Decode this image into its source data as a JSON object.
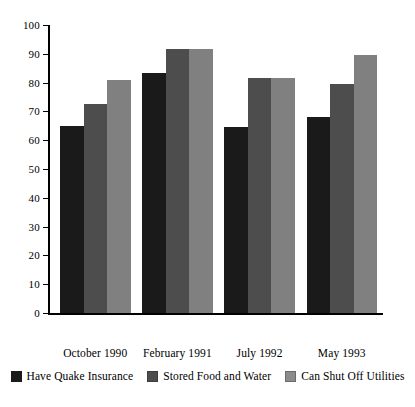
{
  "chart_data": {
    "type": "bar",
    "title": "",
    "subtitle": "",
    "xlabel": "",
    "ylabel": "",
    "ylim": [
      0,
      100
    ],
    "yticks": [
      0,
      10,
      20,
      30,
      40,
      50,
      60,
      70,
      80,
      90,
      100
    ],
    "ytick_labels": [
      "0",
      "10",
      "20",
      "30",
      "40",
      "50",
      "60",
      "70",
      "80",
      "90",
      "100"
    ],
    "grid": false,
    "legend_position": "bottom",
    "categories": [
      "October 1990",
      "February 1991",
      "July 1992",
      "May 1993"
    ],
    "series": [
      {
        "name": "Have Quake Insurance",
        "color": "#1a1a1a",
        "values": [
          65,
          83.5,
          64.5,
          68
        ]
      },
      {
        "name": "Stored Food and Water",
        "color": "#4d4d4d",
        "values": [
          72.5,
          91.5,
          81.5,
          79.5
        ]
      },
      {
        "name": "Can Shut Off Utilities",
        "color": "#808080",
        "values": [
          81,
          91.5,
          81.5,
          89.5
        ]
      }
    ]
  },
  "axis": {
    "y_tick_0": "0",
    "y_tick_1": "10",
    "y_tick_2": "20",
    "y_tick_3": "30",
    "y_tick_4": "40",
    "y_tick_5": "50",
    "y_tick_6": "60",
    "y_tick_7": "70",
    "y_tick_8": "80",
    "y_tick_9": "90",
    "y_tick_10": "100"
  },
  "categories": {
    "c0": "October 1990",
    "c1": "February 1991",
    "c2": "July 1992",
    "c3": "May 1993"
  },
  "legend": {
    "items": [
      {
        "label": "Have Quake Insurance",
        "color": "#1a1a1a"
      },
      {
        "label": "Stored Food and Water",
        "color": "#4d4d4d"
      },
      {
        "label": "Can Shut Off Utilities",
        "color": "#8c8c8c"
      }
    ]
  }
}
